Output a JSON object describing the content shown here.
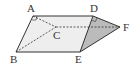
{
  "diagram": {
    "type": "triangular-prism",
    "vertices": {
      "A": {
        "label": "A",
        "x": 33,
        "y": 16
      },
      "B": {
        "label": "B",
        "x": 16,
        "y": 52
      },
      "C": {
        "label": "C",
        "x": 56,
        "y": 27
      },
      "D": {
        "label": "D",
        "x": 93,
        "y": 16
      },
      "E": {
        "label": "E",
        "x": 80,
        "y": 52
      },
      "F": {
        "label": "F",
        "x": 120,
        "y": 27
      }
    },
    "labels": {
      "A": "A",
      "B": "B",
      "C": "C",
      "D": "D",
      "E": "E",
      "F": "F"
    },
    "solid_edges": [
      "AD",
      "AB",
      "BE",
      "DE",
      "DF",
      "EF"
    ],
    "dashed_edges": [
      "AC",
      "BC",
      "CF"
    ],
    "shaded_face": "DEF",
    "right_angle_marks": [
      "A",
      "D"
    ],
    "colors": {
      "line": "#333333",
      "face_light": "#eeeeee",
      "face_shaded": "#bbbbbb"
    }
  }
}
